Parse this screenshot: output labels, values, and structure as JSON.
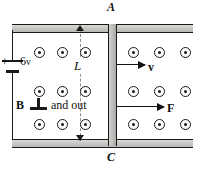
{
  "figure": {
    "type": "physics-diagram"
  },
  "labels": {
    "point_top": "A",
    "point_bottom": "C",
    "length": "L",
    "battery_polarity": "+",
    "battery_value": "6",
    "battery_unit": "v",
    "field_symbol": "B",
    "field_direction_text": "and out",
    "velocity_vector": "v",
    "force_vector": "F"
  },
  "icons": {
    "perpendicular": "perpendicular-icon",
    "field_out_of_page": "field-dot-icon"
  },
  "field_dots": {
    "left_region": {
      "columns_x": [
        34,
        57,
        80
      ],
      "rows_y": [
        47,
        86,
        119
      ],
      "count": 9
    },
    "right_region": {
      "columns_x": [
        128,
        154,
        180
      ],
      "rows_y": [
        47,
        86,
        119
      ],
      "count": 9
    }
  },
  "colors": {
    "outline": "#1a1a1a",
    "rail_fill": "#c8c8c4",
    "background": "#ffffff",
    "dim_line": "#8a8a8a"
  }
}
